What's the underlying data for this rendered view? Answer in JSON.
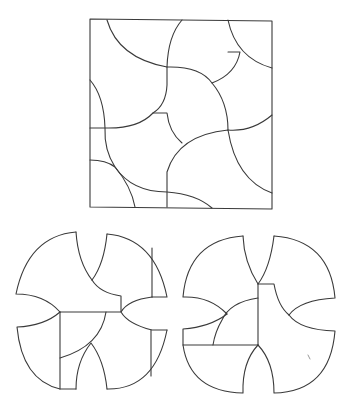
{
  "figure": {
    "caption_cropped": "",
    "stroke_color": "#3a3a3a",
    "background_color": "#ffffff"
  },
  "panels": [
    {
      "id": "square",
      "label": "Square arrangement"
    },
    {
      "id": "shape-left",
      "label": "Four-lobed arrangement (left)"
    },
    {
      "id": "shape-right",
      "label": "Four-lobed arrangement (right)"
    }
  ]
}
